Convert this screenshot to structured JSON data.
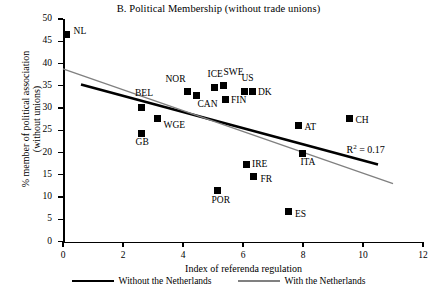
{
  "chart_data": {
    "type": "scatter",
    "title": "B. Political Membership (without trade unions)",
    "xlabel": "Index of referenda regulation",
    "ylabel": "% member of political association (without unions)",
    "ylabel_line1": "% member of political association",
    "ylabel_line2": "(without unions)",
    "xlim": [
      0,
      12
    ],
    "ylim": [
      0,
      50
    ],
    "xticks": [
      0,
      2,
      4,
      6,
      8,
      10,
      12
    ],
    "yticks": [
      0,
      5,
      10,
      15,
      20,
      25,
      30,
      35,
      40,
      45,
      50
    ],
    "grid": false,
    "annotation": "R2 = 0.17",
    "annotation_prefix": "R",
    "annotation_sup": "2",
    "annotation_suffix": "= 0.17",
    "points": [
      {
        "label": "NL",
        "x": 0.12,
        "y": 46.5,
        "label_dx": 7,
        "label_dy": -4
      },
      {
        "label": "BEL",
        "x": 2.6,
        "y": 30.2,
        "label_dx": -6,
        "label_dy": -14
      },
      {
        "label": "GB",
        "x": 2.62,
        "y": 24.2,
        "label_dx": -6,
        "label_dy": 8
      },
      {
        "label": "WGE",
        "x": 3.15,
        "y": 27.6,
        "label_dx": 6,
        "label_dy": 6
      },
      {
        "label": "NOR",
        "x": 4.15,
        "y": 33.7,
        "label_dx": -22,
        "label_dy": -13
      },
      {
        "label": "CAN",
        "x": 4.45,
        "y": 32.7,
        "label_dx": 1,
        "label_dy": 8
      },
      {
        "label": "ICE",
        "x": 5.05,
        "y": 34.7,
        "label_dx": -7,
        "label_dy": -13
      },
      {
        "label": "SWE",
        "x": 5.35,
        "y": 35.1,
        "label_dx": 0,
        "label_dy": -13
      },
      {
        "label": "FIN",
        "x": 5.4,
        "y": 32.0,
        "label_dx": 6,
        "label_dy": 1
      },
      {
        "label": "POR",
        "x": 5.15,
        "y": 11.5,
        "label_dx": -6,
        "label_dy": 10
      },
      {
        "label": "US",
        "x": 6.05,
        "y": 33.8,
        "label_dx": -3,
        "label_dy": -13
      },
      {
        "label": "DK",
        "x": 6.3,
        "y": 33.8,
        "label_dx": 6,
        "label_dy": 1
      },
      {
        "label": "IRE",
        "x": 6.1,
        "y": 17.4,
        "label_dx": 6,
        "label_dy": 0
      },
      {
        "label": "FR",
        "x": 6.35,
        "y": 14.5,
        "label_dx": 7,
        "label_dy": 2
      },
      {
        "label": "ES",
        "x": 7.5,
        "y": 6.7,
        "label_dx": 7,
        "label_dy": 2
      },
      {
        "label": "AT",
        "x": 7.85,
        "y": 26.0,
        "label_dx": 6,
        "label_dy": 1
      },
      {
        "label": "ITA",
        "x": 7.98,
        "y": 19.8,
        "label_dx": -2,
        "label_dy": 9
      },
      {
        "label": "CH",
        "x": 9.55,
        "y": 27.6,
        "label_dx": 6,
        "label_dy": 1
      }
    ],
    "series": [
      {
        "name": "Without the Netherlands",
        "type": "line",
        "color": "#000000",
        "width": 2.6,
        "x": [
          0.6,
          10.5
        ],
        "y": [
          35.3,
          17.3
        ]
      },
      {
        "name": "With the Netherlands",
        "type": "line",
        "color": "#808080",
        "width": 1.4,
        "x": [
          0.0,
          11.0
        ],
        "y": [
          38.8,
          13.0
        ]
      }
    ],
    "legend": [
      {
        "label": "Without the Netherlands",
        "style": "black-thick"
      },
      {
        "label": "With the Netherlands",
        "style": "gray-thin"
      }
    ],
    "legend_position": "bottom"
  }
}
